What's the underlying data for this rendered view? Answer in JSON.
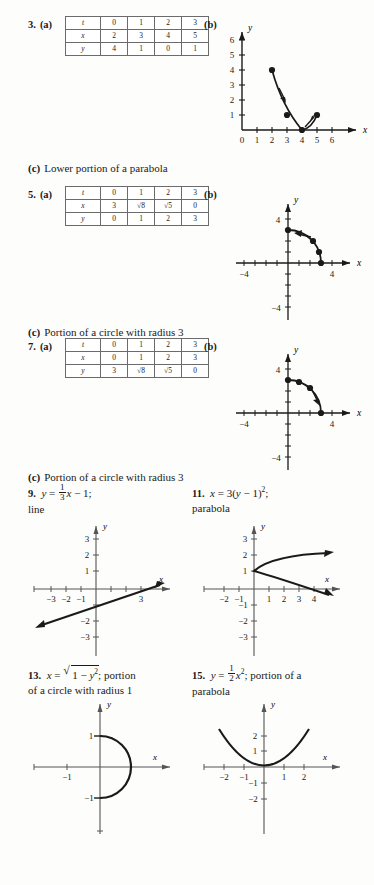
{
  "problems": [
    {
      "number": "3.",
      "part_a_label": "(a)",
      "part_b_label": "(b)",
      "table": {
        "rows": [
          {
            "header": "t",
            "cells": [
              "0",
              "1",
              "2",
              "3"
            ]
          },
          {
            "header": "x",
            "cells": [
              "2",
              "3",
              "4",
              "5"
            ]
          },
          {
            "header": "y",
            "cells": [
              "4",
              "1",
              "0",
              "1"
            ]
          }
        ]
      },
      "part_c_label": "(c)",
      "part_c_text": "Lower portion of a parabola",
      "graph": {
        "type": "scatter",
        "xlabel": "x",
        "ylabel": "y",
        "xticks": [
          "0",
          "1",
          "2",
          "3",
          "4",
          "5",
          "6"
        ],
        "yticks": [
          "1",
          "2",
          "3",
          "4",
          "5",
          "6"
        ],
        "points": [
          [
            2,
            4
          ],
          [
            3,
            1
          ],
          [
            4,
            0
          ],
          [
            5,
            1
          ]
        ],
        "curve": "parabola through plotted points, arrows indicate direction of increasing t"
      }
    },
    {
      "number": "5.",
      "part_a_label": "(a)",
      "part_b_label": "(b)",
      "table": {
        "rows": [
          {
            "header": "t",
            "cells": [
              "0",
              "1",
              "2",
              "3"
            ]
          },
          {
            "header": "x",
            "cells": [
              "3",
              "√8",
              "√5",
              "0"
            ]
          },
          {
            "header": "y",
            "cells": [
              "0",
              "1",
              "2",
              "3"
            ]
          }
        ]
      },
      "part_c_label": "(c)",
      "part_c_text": "Portion of a circle with radius 3",
      "graph": {
        "type": "scatter",
        "xlabel": "x",
        "ylabel": "y",
        "xticks": [
          "-4",
          "4"
        ],
        "yticks": [
          "4",
          "-4"
        ],
        "points": [
          [
            3,
            0
          ],
          [
            2.83,
            1
          ],
          [
            2.24,
            2
          ],
          [
            0,
            3
          ]
        ],
        "curve": "quarter circle radius 3, arrow points counterclockwise toward (0,3)"
      }
    },
    {
      "number": "7.",
      "part_a_label": "(a)",
      "part_b_label": "(b)",
      "table": {
        "rows": [
          {
            "header": "t",
            "cells": [
              "0",
              "1",
              "2",
              "3"
            ]
          },
          {
            "header": "x",
            "cells": [
              "0",
              "1",
              "2",
              "3"
            ]
          },
          {
            "header": "y",
            "cells": [
              "3",
              "√8",
              "√5",
              "0"
            ]
          }
        ]
      },
      "part_c_label": "(c)",
      "part_c_text": "Portion of a circle with radius 3",
      "graph": {
        "type": "scatter",
        "xlabel": "x",
        "ylabel": "y",
        "xticks": [
          "-4",
          "4"
        ],
        "yticks": [
          "4",
          "-4"
        ],
        "points": [
          [
            0,
            3
          ],
          [
            1,
            2.83
          ],
          [
            2,
            2.24
          ],
          [
            3,
            0
          ]
        ],
        "curve": "quarter circle radius 3, arrow points clockwise toward (3,0)"
      }
    }
  ],
  "answers": [
    {
      "number": "9.",
      "equation_plain": "y = 1/3 x - 1;",
      "description": "line",
      "graph": {
        "type": "line",
        "xlabel": "x",
        "ylabel": "y",
        "xticks": [
          "-3",
          "-2",
          "-1",
          "3"
        ],
        "yticks": [
          "3",
          "2",
          "1",
          "-2",
          "-3"
        ],
        "slope": 0.3333,
        "intercept": -1,
        "xrange": [
          -4.2,
          3.8
        ]
      }
    },
    {
      "number": "11.",
      "equation_plain": "x = 3(y - 1)^2;",
      "description": "parabola",
      "graph": {
        "type": "line",
        "xlabel": "x",
        "ylabel": "y",
        "xticks": [
          "-2",
          "-1",
          "1",
          "2",
          "3",
          "4"
        ],
        "yticks": [
          "3",
          "2",
          "1",
          "-1",
          "-2",
          "-3"
        ],
        "vertex": [
          0,
          1
        ],
        "opens": "right",
        "coefficient": 3
      }
    },
    {
      "number": "13.",
      "equation_plain": "x = √(1 - y^2); portion",
      "description": "of a circle with radius 1",
      "graph": {
        "type": "line",
        "xlabel": "x",
        "ylabel": "y",
        "xticks": [
          "-1"
        ],
        "yticks": [
          "1",
          "-1"
        ],
        "curve": "right half of unit circle from (0,1) to (0,-1)",
        "radius": 1
      }
    },
    {
      "number": "15.",
      "equation_plain": "y = 1/2 x^2; portion of a",
      "description": "parabola",
      "graph": {
        "type": "line",
        "xlabel": "x",
        "ylabel": "y",
        "xticks": [
          "-2",
          "-1",
          "1",
          "2"
        ],
        "yticks": [
          "2",
          "1",
          "-1",
          "-2"
        ],
        "vertex": [
          0,
          0
        ],
        "opens": "up",
        "coefficient": 0.5
      }
    }
  ]
}
